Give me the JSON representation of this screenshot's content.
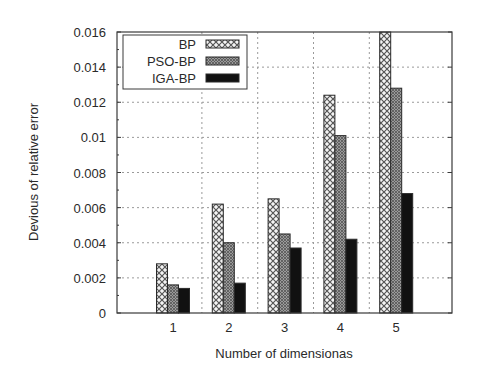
{
  "chart_data": {
    "type": "bar",
    "title": "",
    "xlabel": "Number of dimensionas",
    "ylabel": "Devious of relative error",
    "categories": [
      "1",
      "2",
      "3",
      "4",
      "5"
    ],
    "series": [
      {
        "name": "BP",
        "pattern": "crosshatch-light",
        "values": [
          0.0028,
          0.0062,
          0.0065,
          0.0124,
          0.016
        ]
      },
      {
        "name": "PSO-BP",
        "pattern": "crosshatch-gray",
        "values": [
          0.0016,
          0.004,
          0.0045,
          0.0101,
          0.0128
        ]
      },
      {
        "name": "IGA-BP",
        "pattern": "solid-black",
        "values": [
          0.0014,
          0.0017,
          0.0037,
          0.0042,
          0.0068
        ]
      }
    ],
    "ylim": [
      0,
      0.016
    ],
    "yticks": [
      "0",
      "0.002",
      "0.004",
      "0.006",
      "0.008",
      "0.01",
      "0.012",
      "0.014",
      "0.016"
    ],
    "grid": true,
    "grid_style": "dotted",
    "legend_position": "upper-left"
  },
  "colors": {
    "axis": "#3a3a3a",
    "grid": "#9a9a9a",
    "bar_outline": "#2a2a2a",
    "bp_fill": "#f2f2f2",
    "bp_hatch": "#555555",
    "pso_fill": "#8a8a8a",
    "pso_hatch": "#5a5a5a",
    "iga_fill": "#111111"
  }
}
